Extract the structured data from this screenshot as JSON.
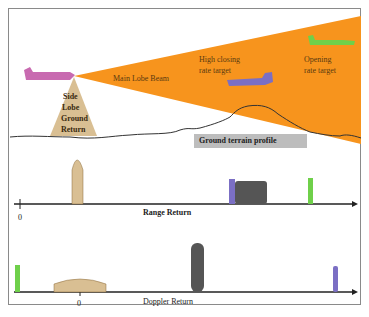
{
  "scene": {
    "main_lobe_label": "Main Lobe Beam",
    "side_lobe_label": [
      "Side",
      "Lobe",
      "Ground",
      "Return"
    ],
    "high_closing_label": [
      "High closing",
      "rate target"
    ],
    "opening_label": [
      "Opening",
      "rate target"
    ],
    "terrain_label": "Ground terrain profile"
  },
  "range_plot": {
    "axis_label": "Range Return",
    "origin_label": "0"
  },
  "doppler_plot": {
    "axis_label": "Doppler Return",
    "origin_label": "0"
  },
  "colors": {
    "beam": "#f7941d",
    "own_aircraft": "#c86ab0",
    "closing_target": "#7b6fc4",
    "opening_target": "#6fd04a",
    "side_lobe": "#d9bf93",
    "terrain_box": "#bdbdbd",
    "clutter": "#555555"
  }
}
